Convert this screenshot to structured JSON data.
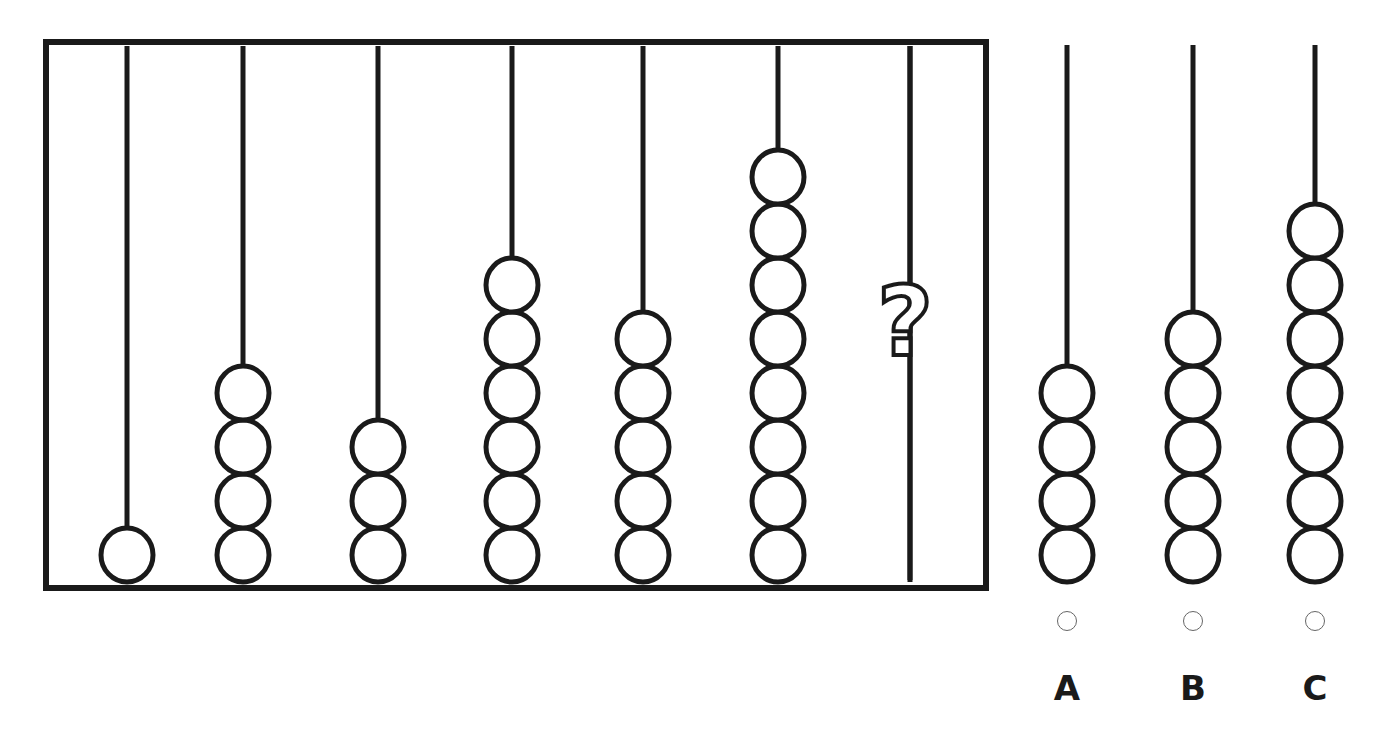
{
  "puzzle": {
    "frame": {
      "x": 46,
      "y": 42,
      "width": 940,
      "height": 546,
      "stroke": "#1a1a1a"
    },
    "rods": [
      {
        "x": 127,
        "beads": 1
      },
      {
        "x": 243,
        "beads": 4
      },
      {
        "x": 378,
        "beads": 3
      },
      {
        "x": 512,
        "beads": 6
      },
      {
        "x": 643,
        "beads": 5
      },
      {
        "x": 778,
        "beads": 8
      },
      {
        "x": 910,
        "beads": null,
        "unknown": true,
        "mark": "?"
      }
    ],
    "sequence_visible": [
      1,
      4,
      3,
      6,
      5,
      8,
      "?"
    ]
  },
  "options": [
    {
      "label": "A",
      "x": 1067,
      "beads": 4
    },
    {
      "label": "B",
      "x": 1193,
      "beads": 5
    },
    {
      "label": "C",
      "x": 1315,
      "beads": 7
    }
  ],
  "colors": {
    "ink": "#1a1a1a",
    "radio": "#666666",
    "background": "#ffffff"
  }
}
